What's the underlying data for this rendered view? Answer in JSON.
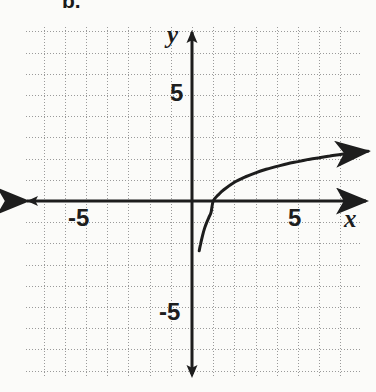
{
  "figure": {
    "label": "b.",
    "kind": "coordinate-plane-graph",
    "background_color": "#fbfbf9",
    "ink_color": "#1d1d1d",
    "grid_color": "#9a9a9a"
  },
  "axes": {
    "x_name": "x",
    "y_name": "y",
    "x_ticks": [
      {
        "id": "x-neg",
        "label": "-5",
        "value": -5
      },
      {
        "id": "x-pos",
        "label": "5",
        "value": 5
      }
    ],
    "y_ticks": [
      {
        "id": "y-pos",
        "label": "5",
        "value": 5
      },
      {
        "id": "y-neg",
        "label": "-5",
        "value": -5
      }
    ],
    "origin_px": {
      "x": 192,
      "y": 201
    },
    "unit_px": 21.2,
    "x_range": [
      -8,
      8.3
    ],
    "y_range": [
      -8.2,
      8.2
    ],
    "arrows": [
      "left",
      "right",
      "up",
      "down"
    ]
  },
  "chart_data": {
    "type": "line",
    "title": "",
    "xlabel": "x",
    "ylabel": "y",
    "xlim": [
      -8,
      8.3
    ],
    "ylim": [
      -8.2,
      8.2
    ],
    "grid": true,
    "legend": null,
    "series": [
      {
        "name": "y = log(x)",
        "description": "logarithmic curve, vertical asymptote at x = 0, x-intercept at (1, 0), increasing and concave down",
        "asymptote_x": 0,
        "x_intercept": 1,
        "has_arrow_end": true,
        "x": [
          0.34,
          0.4,
          0.5,
          0.6,
          0.7,
          0.8,
          0.9,
          1.0,
          1.25,
          1.5,
          2.0,
          2.5,
          3.0,
          3.5,
          4.0,
          4.5,
          5.0,
          5.5,
          6.0,
          6.5,
          7.0,
          7.5,
          8.0,
          8.3
        ],
        "y": [
          -2.35,
          -2.05,
          -1.62,
          -1.27,
          -1.0,
          -0.76,
          -0.53,
          0.0,
          0.3,
          0.53,
          0.88,
          1.13,
          1.33,
          1.5,
          1.63,
          1.76,
          1.86,
          1.96,
          2.04,
          2.12,
          2.19,
          2.26,
          2.32,
          2.35
        ]
      }
    ]
  }
}
